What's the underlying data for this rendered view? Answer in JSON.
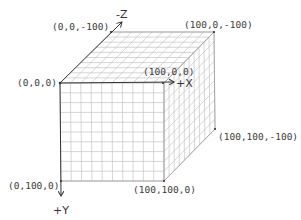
{
  "diagram": {
    "grid_divisions": 10,
    "colors": {
      "background": "#ffffff",
      "grid": "#c4c4c4",
      "edge": "#9a9a9a",
      "axis": "#333333",
      "text": "#3a3a3a"
    },
    "axes": {
      "x": {
        "label": "+X"
      },
      "y": {
        "label": "+Y"
      },
      "z": {
        "label": "-Z"
      }
    },
    "vertices": {
      "origin": {
        "label": "(0,0,0)"
      },
      "back_left_top": {
        "label": "(0,0,-100)"
      },
      "back_right_top": {
        "label": "(100,0,-100)"
      },
      "front_right_top": {
        "label": "(100,0,0)"
      },
      "back_right_bottom": {
        "label": "(100,100,-100)"
      },
      "front_right_bottom": {
        "label": "(100,100,0)"
      },
      "front_left_bottom": {
        "label": "(0,100,0)"
      }
    }
  }
}
